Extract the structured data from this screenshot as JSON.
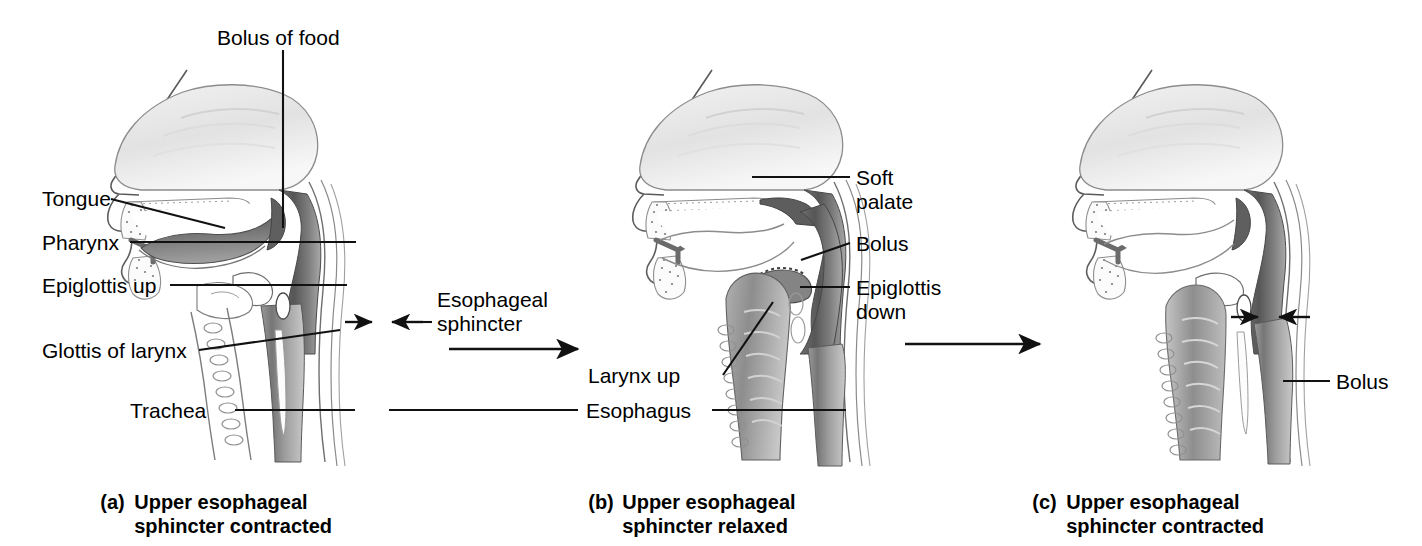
{
  "figure": {
    "background_color": "#ffffff",
    "ink_color": "#1a1a1a"
  },
  "panels": [
    {
      "id": "a",
      "letter": "(a)",
      "caption_line1": "Upper esophageal",
      "caption_line2": "sphincter contracted",
      "labels": [
        {
          "name": "bolus-of-food",
          "text": "Bolus of food"
        },
        {
          "name": "tongue",
          "text": "Tongue"
        },
        {
          "name": "pharynx",
          "text": "Pharynx"
        },
        {
          "name": "epiglottis-up",
          "text": "Epiglottis up"
        },
        {
          "name": "glottis-of-larynx",
          "text": "Glottis of larynx"
        },
        {
          "name": "trachea",
          "text": "Trachea"
        }
      ]
    },
    {
      "id": "b",
      "letter": "(b)",
      "caption_line1": "Upper esophageal",
      "caption_line2": "sphincter relaxed",
      "labels": [
        {
          "name": "soft-palate",
          "text_line1": "Soft",
          "text_line2": "palate"
        },
        {
          "name": "bolus",
          "text": "Bolus"
        },
        {
          "name": "epiglottis-down",
          "text_line1": "Epiglottis",
          "text_line2": "down"
        },
        {
          "name": "larynx-up",
          "text": "Larynx up"
        },
        {
          "name": "esophagus",
          "text": "Esophagus"
        }
      ]
    },
    {
      "id": "c",
      "letter": "(c)",
      "caption_line1": "Upper esophageal",
      "caption_line2": "sphincter contracted",
      "labels": [
        {
          "name": "bolus",
          "text": "Bolus"
        }
      ]
    }
  ],
  "shared_labels": [
    {
      "name": "esophageal-sphincter",
      "text_line1": "Esophageal",
      "text_line2": "sphincter"
    }
  ],
  "flow_arrows": [
    {
      "name": "arrow-a-to-b",
      "direction": "right"
    },
    {
      "name": "arrow-b-to-c",
      "direction": "right"
    }
  ]
}
